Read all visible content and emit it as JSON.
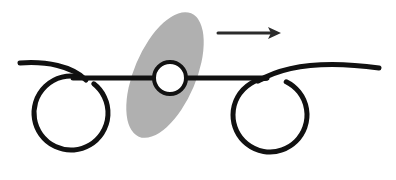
{
  "figure": {
    "canvas": {
      "width": 396,
      "height": 180,
      "background": "#ffffff"
    },
    "palette": {
      "ink": "#111111",
      "ellipse_gray": "#b0b0b0",
      "hub_fill": "#ffffff",
      "arrow": "#2b2b2b"
    },
    "elements": {
      "left_wheel": {
        "name": "left-wheel-loop",
        "center_x": 71,
        "center_y": 113,
        "radius": 37,
        "stroke_width": 5,
        "gap_start_deg": -78,
        "gap_end_deg": -52,
        "tail_label": "left spiral tail"
      },
      "right_wheel": {
        "name": "right-wheel-loop",
        "center_x": 270,
        "center_y": 115,
        "radius": 37,
        "stroke_width": 5,
        "gap_start_deg": -96,
        "gap_end_deg": -64,
        "tail_label": "right spiral tail"
      },
      "left_tail": {
        "name": "left-tail-curve",
        "start_x": 20,
        "start_y": 63,
        "end_x": 86,
        "end_y": 80,
        "stroke_width": 5
      },
      "right_tail": {
        "name": "right-tail-curve",
        "start_x": 255,
        "start_y": 82,
        "end_x": 379,
        "end_y": 68,
        "stroke_width": 5
      },
      "axle_bar": {
        "name": "horizontal-axle-bar",
        "x1": 73,
        "y1": 78,
        "x2": 267,
        "y2": 78,
        "stroke_width": 5
      },
      "hub_circle": {
        "name": "center-hub-circle",
        "center_x": 170,
        "center_y": 78,
        "radius": 16,
        "stroke_width": 4
      },
      "gray_ellipse": {
        "name": "tilted-gray-ellipse",
        "center_x": 165,
        "center_y": 75,
        "radius_x": 31,
        "radius_y": 67,
        "rotation_deg": 23,
        "fill": "#b0b0b0"
      },
      "motion_arrow": {
        "name": "motion-arrow",
        "x1": 218,
        "y1": 33,
        "x2": 281,
        "y2": 33,
        "stroke_width": 3,
        "head_length": 13,
        "head_half_width": 6,
        "direction": "right"
      }
    }
  }
}
